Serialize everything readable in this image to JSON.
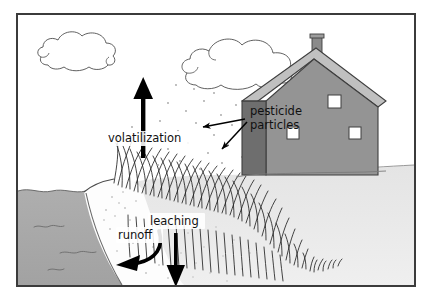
{
  "figure": {
    "frame": {
      "border_color": "#3b3b3b",
      "background": "#ffffff"
    }
  },
  "labels": {
    "volatilization": "volatilization",
    "pesticide_particles_line1": "pesticide",
    "pesticide_particles_line2": "particles",
    "leaching": "leaching",
    "runoff": "runoff"
  },
  "scene": {
    "sky": {
      "name": "sky",
      "color": "#ffffff"
    },
    "clouds": [
      {
        "name": "cloud-left",
        "outline_color": "#4a4a4a",
        "fill": "#ffffff"
      },
      {
        "name": "cloud-right",
        "outline_color": "#4a4a4a",
        "fill": "#ffffff"
      }
    ],
    "water": {
      "name": "water-body",
      "color": "#a9a9a9"
    },
    "bank": {
      "name": "stream-bank",
      "color": "#fdfdfd"
    },
    "ground": {
      "name": "soil-ground",
      "color": "#e9e9e9"
    },
    "grass": {
      "name": "grass-field",
      "stroke_color": "#2b2b2b"
    },
    "house": {
      "name": "farm-house",
      "wall_color": "#8e8e8e",
      "side_wall_color": "#6f6f6f",
      "roof_color": "#b9b9b9",
      "roof_shadow_color": "#9a9a9a",
      "window_color": "#ffffff",
      "chimney_color": "#8a8a8a",
      "window_count": 3
    },
    "particles": {
      "name": "pesticide-particle-dots",
      "color": "#9b9b9b"
    }
  },
  "arrows": {
    "volatilization": {
      "name": "volatilization-arrow",
      "direction": "up",
      "color": "#000000"
    },
    "leaching": {
      "name": "leaching-arrow",
      "direction": "down",
      "color": "#000000"
    },
    "runoff": {
      "name": "runoff-arrow",
      "direction": "curved-left-down",
      "color": "#000000"
    },
    "pesticide_1": {
      "name": "pesticide-pointer-arrow-left",
      "direction": "left",
      "color": "#000000"
    },
    "pesticide_2": {
      "name": "pesticide-pointer-arrow-down-left",
      "direction": "down-left",
      "color": "#000000"
    }
  }
}
